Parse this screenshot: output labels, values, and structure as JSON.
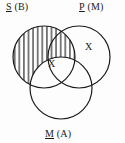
{
  "diagram": {
    "kind": "venn-diagram-3-circle",
    "title_visible": false,
    "stroke_color": "#1a1a1a",
    "background_color": "#fdfdfd",
    "labels": {
      "top_left": {
        "term": "S",
        "paren": "(B)",
        "full": "S (B)"
      },
      "top_right": {
        "term": "P",
        "paren": "(M)",
        "full": "P (M)"
      },
      "bottom": {
        "term": "M",
        "paren": "(A)",
        "full": "M (A)"
      }
    },
    "circles": [
      {
        "name": "S",
        "label": "S (B)",
        "cx": 44,
        "cy": 57,
        "r": 31,
        "shaded": true,
        "shading": "vertical-hatch"
      },
      {
        "name": "P",
        "label": "P (M)",
        "cx": 79,
        "cy": 57,
        "r": 31,
        "shaded": false,
        "shading": "none"
      },
      {
        "name": "M",
        "label": "M (A)",
        "cx": 61,
        "cy": 88,
        "r": 31,
        "shaded": false,
        "shading": "none"
      }
    ],
    "marks": [
      {
        "symbol": "X",
        "region": "S-and-M-minus-P",
        "x": 52,
        "y": 65
      },
      {
        "symbol": "X",
        "region": "P-only",
        "x": 89,
        "y": 48
      }
    ]
  }
}
